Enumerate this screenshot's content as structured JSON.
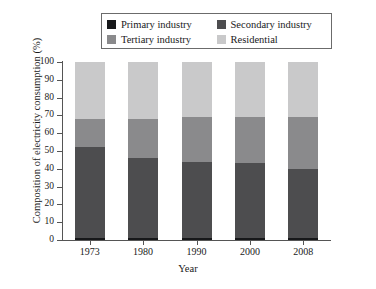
{
  "chart_data": {
    "type": "bar",
    "stacked": true,
    "title": "",
    "xlabel": "Year",
    "ylabel": "Composition of electricity consumption (%)",
    "categories": [
      "1973",
      "1980",
      "1990",
      "2000",
      "2008"
    ],
    "ylim": [
      0,
      100
    ],
    "yticks": [
      "0",
      "10",
      "20",
      "30",
      "40",
      "50",
      "60",
      "70",
      "80",
      "90",
      "100"
    ],
    "grid": false,
    "legend_position": "top",
    "series": [
      {
        "name": "Primary industry",
        "color": "#17181a",
        "values": [
          1,
          1,
          1,
          1,
          1
        ]
      },
      {
        "name": "Secondary industry",
        "color": "#4d4d4f",
        "values": [
          51,
          45,
          43,
          42,
          39
        ]
      },
      {
        "name": "Tertiary industry",
        "color": "#8a8a8c",
        "values": [
          16,
          22,
          25,
          26,
          29
        ]
      },
      {
        "name": "Residential",
        "color": "#c9c9ca",
        "values": [
          32,
          32,
          31,
          31,
          31
        ]
      }
    ]
  },
  "legend": {
    "items": [
      {
        "label": "Primary industry",
        "color": "#17181a"
      },
      {
        "label": "Secondary industry",
        "color": "#4d4d4f"
      },
      {
        "label": "Tertiary industry",
        "color": "#8a8a8c"
      },
      {
        "label": "Residential",
        "color": "#c9c9ca"
      }
    ]
  }
}
